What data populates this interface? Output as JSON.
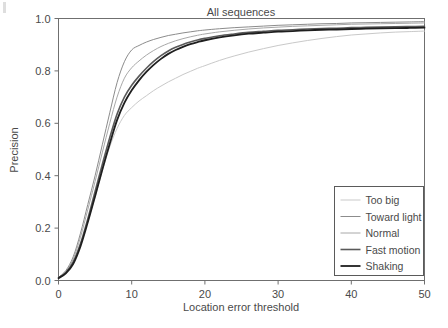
{
  "chart_data": {
    "type": "line",
    "title": "All sequences",
    "xlabel": "Location error threshold",
    "ylabel": "Precision",
    "xlim": [
      0,
      50
    ],
    "ylim": [
      0.0,
      1.0
    ],
    "xticks": [
      0,
      10,
      20,
      30,
      40,
      50
    ],
    "yticks": [
      0.0,
      0.2,
      0.4,
      0.6,
      0.8,
      1.0
    ],
    "xtick_labels": [
      "0",
      "10",
      "20",
      "30",
      "40",
      "50"
    ],
    "ytick_labels": [
      "0.0",
      "0.2",
      "0.4",
      "0.6",
      "0.8",
      "1.0"
    ],
    "grid": false,
    "legend_position": "lower right",
    "x": [
      0,
      1,
      2,
      3,
      4,
      5,
      6,
      7,
      8,
      9,
      10,
      11,
      12,
      13,
      14,
      15,
      16,
      17,
      18,
      19,
      20,
      22,
      24,
      26,
      28,
      30,
      32,
      34,
      36,
      38,
      40,
      42,
      44,
      46,
      48,
      50
    ],
    "series": [
      {
        "name": "Too big",
        "color": "#c9c9c9",
        "width": 1.0,
        "values": [
          0.01,
          0.03,
          0.07,
          0.14,
          0.225,
          0.32,
          0.42,
          0.51,
          0.58,
          0.63,
          0.66,
          0.685,
          0.705,
          0.725,
          0.742,
          0.758,
          0.772,
          0.786,
          0.798,
          0.81,
          0.82,
          0.84,
          0.857,
          0.872,
          0.885,
          0.897,
          0.907,
          0.916,
          0.924,
          0.931,
          0.937,
          0.941,
          0.945,
          0.948,
          0.95,
          0.952
        ]
      },
      {
        "name": "Toward light",
        "color": "#8c8c8c",
        "width": 1.0,
        "values": [
          0.012,
          0.038,
          0.09,
          0.18,
          0.29,
          0.4,
          0.52,
          0.64,
          0.755,
          0.835,
          0.88,
          0.897,
          0.91,
          0.92,
          0.928,
          0.935,
          0.94,
          0.945,
          0.949,
          0.953,
          0.956,
          0.961,
          0.965,
          0.968,
          0.971,
          0.974,
          0.976,
          0.978,
          0.98,
          0.981,
          0.983,
          0.984,
          0.985,
          0.986,
          0.987,
          0.988
        ]
      },
      {
        "name": "Normal",
        "color": "#a8a8a8",
        "width": 1.0,
        "values": [
          0.011,
          0.034,
          0.082,
          0.165,
          0.27,
          0.378,
          0.49,
          0.6,
          0.7,
          0.772,
          0.812,
          0.838,
          0.86,
          0.878,
          0.893,
          0.905,
          0.915,
          0.923,
          0.93,
          0.936,
          0.941,
          0.949,
          0.955,
          0.96,
          0.964,
          0.967,
          0.97,
          0.972,
          0.974,
          0.976,
          0.978,
          0.979,
          0.98,
          0.981,
          0.982,
          0.983
        ]
      },
      {
        "name": "Fast motion",
        "color": "#5a5a5a",
        "width": 1.6,
        "values": [
          0.01,
          0.03,
          0.07,
          0.14,
          0.235,
          0.34,
          0.445,
          0.545,
          0.635,
          0.7,
          0.745,
          0.78,
          0.81,
          0.836,
          0.858,
          0.876,
          0.89,
          0.901,
          0.91,
          0.918,
          0.924,
          0.934,
          0.941,
          0.947,
          0.951,
          0.955,
          0.957,
          0.96,
          0.962,
          0.963,
          0.965,
          0.966,
          0.967,
          0.968,
          0.969,
          0.97
        ]
      },
      {
        "name": "Shaking",
        "color": "#1f1f1f",
        "width": 1.8,
        "values": [
          0.009,
          0.027,
          0.063,
          0.13,
          0.222,
          0.322,
          0.425,
          0.522,
          0.612,
          0.678,
          0.726,
          0.764,
          0.796,
          0.823,
          0.846,
          0.865,
          0.88,
          0.892,
          0.902,
          0.91,
          0.917,
          0.928,
          0.936,
          0.942,
          0.946,
          0.95,
          0.952,
          0.955,
          0.957,
          0.958,
          0.96,
          0.961,
          0.962,
          0.963,
          0.964,
          0.965
        ]
      }
    ]
  },
  "legend": {
    "entries": [
      {
        "label": "Too big"
      },
      {
        "label": "Toward light"
      },
      {
        "label": "Normal"
      },
      {
        "label": "Fast motion"
      },
      {
        "label": "Shaking"
      }
    ]
  }
}
